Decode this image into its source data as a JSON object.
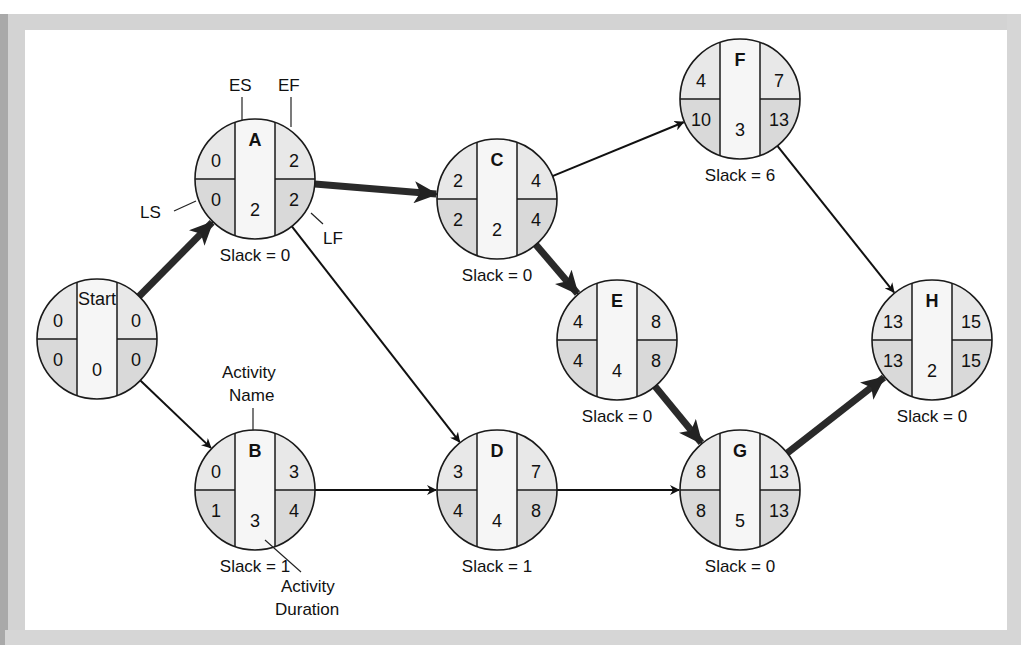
{
  "diagram": {
    "type": "activity-on-node network (critical path)",
    "legend": {
      "es": "ES",
      "ef": "EF",
      "ls": "LS",
      "lf": "LF",
      "activity_name_line1": "Activity",
      "activity_name_line2": "Name",
      "activity_duration_line1": "Activity",
      "activity_duration_line2": "Duration"
    },
    "nodes": [
      {
        "id": "Start",
        "name": "Start",
        "es": "0",
        "ef": "0",
        "ls": "0",
        "lf": "0",
        "duration": "0",
        "slack": "",
        "cx": 97,
        "cy": 339
      },
      {
        "id": "A",
        "name": "A",
        "es": "0",
        "ef": "2",
        "ls": "0",
        "lf": "2",
        "duration": "2",
        "slack": "Slack = 0",
        "cx": 255,
        "cy": 179
      },
      {
        "id": "B",
        "name": "B",
        "es": "0",
        "ef": "3",
        "ls": "1",
        "lf": "4",
        "duration": "3",
        "slack": "Slack = 1",
        "cx": 255,
        "cy": 490
      },
      {
        "id": "C",
        "name": "C",
        "es": "2",
        "ef": "4",
        "ls": "2",
        "lf": "4",
        "duration": "2",
        "slack": "Slack = 0",
        "cx": 497,
        "cy": 199
      },
      {
        "id": "D",
        "name": "D",
        "es": "3",
        "ef": "7",
        "ls": "4",
        "lf": "8",
        "duration": "4",
        "slack": "Slack = 1",
        "cx": 497,
        "cy": 490
      },
      {
        "id": "E",
        "name": "E",
        "es": "4",
        "ef": "8",
        "ls": "4",
        "lf": "8",
        "duration": "4",
        "slack": "Slack = 0",
        "cx": 617,
        "cy": 340
      },
      {
        "id": "F",
        "name": "F",
        "es": "4",
        "ef": "7",
        "ls": "10",
        "lf": "13",
        "duration": "3",
        "slack": "Slack = 6",
        "cx": 740,
        "cy": 99
      },
      {
        "id": "G",
        "name": "G",
        "es": "8",
        "ef": "13",
        "ls": "8",
        "lf": "13",
        "duration": "5",
        "slack": "Slack = 0",
        "cx": 740,
        "cy": 490
      },
      {
        "id": "H",
        "name": "H",
        "es": "13",
        "ef": "15",
        "ls": "13",
        "lf": "15",
        "duration": "2",
        "slack": "Slack = 0",
        "cx": 932,
        "cy": 340
      }
    ],
    "edges": [
      {
        "from": "Start",
        "to": "A",
        "critical": true
      },
      {
        "from": "Start",
        "to": "B",
        "critical": false
      },
      {
        "from": "A",
        "to": "C",
        "critical": true
      },
      {
        "from": "A",
        "to": "D",
        "critical": false
      },
      {
        "from": "B",
        "to": "D",
        "critical": false
      },
      {
        "from": "C",
        "to": "E",
        "critical": true
      },
      {
        "from": "C",
        "to": "F",
        "critical": false
      },
      {
        "from": "D",
        "to": "G",
        "critical": false
      },
      {
        "from": "E",
        "to": "G",
        "critical": true
      },
      {
        "from": "F",
        "to": "H",
        "critical": false
      },
      {
        "from": "G",
        "to": "H",
        "critical": true
      }
    ],
    "colors": {
      "cell_top": "#e8e8e8",
      "cell_bottom": "#d9d9d9",
      "center_column": "#f6f6f6",
      "stroke": "#1a1a1a",
      "frame": "#d3d3d3"
    }
  }
}
